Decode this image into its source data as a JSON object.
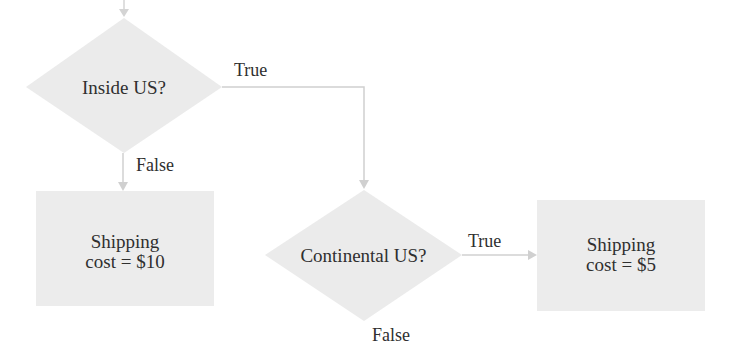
{
  "diagram": {
    "type": "flowchart",
    "colors": {
      "shape_fill": "#ebebeb",
      "connector": "#d0d0d0",
      "text": "#2f2f2f",
      "background": "#ffffff"
    },
    "nodes": {
      "inside_us": {
        "shape": "diamond",
        "label": "Inside US?"
      },
      "continental_us": {
        "shape": "diamond",
        "label": "Continental US?"
      },
      "shipping_10": {
        "shape": "rectangle",
        "line1": "Shipping",
        "line2": "cost = $10"
      },
      "shipping_5": {
        "shape": "rectangle",
        "line1": "Shipping",
        "line2": "cost = $5"
      }
    },
    "edges": {
      "inside_true": {
        "from": "inside_us",
        "to": "continental_us",
        "label": "True"
      },
      "inside_false": {
        "from": "inside_us",
        "to": "shipping_10",
        "label": "False"
      },
      "continental_true": {
        "from": "continental_us",
        "to": "shipping_5",
        "label": "True"
      },
      "continental_false": {
        "from": "continental_us",
        "to": "",
        "label": "False"
      }
    }
  }
}
